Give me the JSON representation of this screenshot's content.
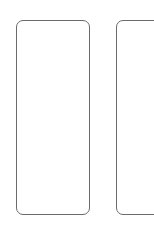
{
  "cards": [
    {
      "label": ""
    },
    {
      "label": ""
    }
  ],
  "colors": {
    "background": "#ffffff",
    "border": "#6b6b6b"
  }
}
